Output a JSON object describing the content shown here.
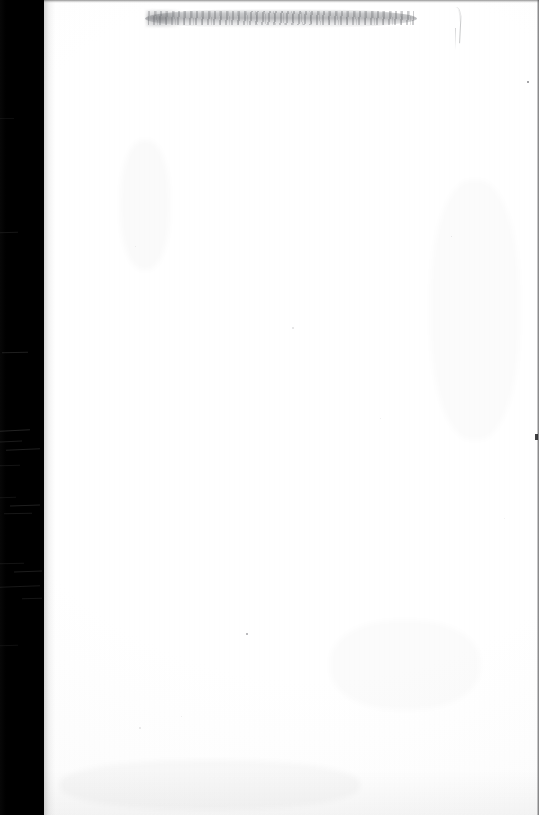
{
  "document": {
    "kind": "scanned-page",
    "title": "Scanned blank page",
    "page_state": "blank",
    "visible_text": "",
    "width_px": 539,
    "height_px": 815,
    "orientation": "portrait"
  },
  "colors": {
    "paper": "#ffffff",
    "paper_shade": "#fbfbfb",
    "gutter": "#000000",
    "smudge": "#808286",
    "edge_line": "#46464a",
    "speck": "#5a5a5e"
  },
  "regions": {
    "spine_gutter": {
      "name": "spine-gutter",
      "description": "black scanner void along the left binding edge",
      "x": 0,
      "y": 0,
      "width": 44,
      "height": 815
    },
    "paper": {
      "name": "paper-surface",
      "description": "blank white page surface",
      "x": 44,
      "y": 0,
      "width": 495,
      "height": 815
    },
    "top_smudge": {
      "name": "top-smudge-band",
      "description": "horizontal grey shadow smudge near the top edge of the sheet",
      "x": 145,
      "y": 9,
      "width": 272,
      "height": 19
    },
    "crease_stroke": {
      "name": "crease-stroke",
      "description": "faint curved pen or crease mark in the upper right",
      "x": 451,
      "y": 7,
      "width": 9,
      "height": 50
    },
    "right_edge": {
      "name": "right-edge-line",
      "description": "thin dark scan boundary along the right edge",
      "x": 537,
      "y": 0,
      "width": 2,
      "height": 815
    }
  },
  "gutter_scratches": [
    {
      "x": 0,
      "y": 232,
      "width": 18,
      "height": 1,
      "angle": -2,
      "opacity": 0.22
    },
    {
      "x": 2,
      "y": 352,
      "width": 26,
      "height": 1,
      "angle": -1.5,
      "opacity": 0.3
    },
    {
      "x": 0,
      "y": 430,
      "width": 30,
      "height": 1,
      "angle": -3,
      "opacity": 0.34
    },
    {
      "x": 0,
      "y": 441,
      "width": 22,
      "height": 1,
      "angle": -2,
      "opacity": 0.26
    },
    {
      "x": 6,
      "y": 449,
      "width": 34,
      "height": 1,
      "angle": -2.5,
      "opacity": 0.3
    },
    {
      "x": 0,
      "y": 465,
      "width": 20,
      "height": 1,
      "angle": -1,
      "opacity": 0.2
    },
    {
      "x": 0,
      "y": 497,
      "width": 16,
      "height": 1,
      "angle": -1,
      "opacity": 0.18
    },
    {
      "x": 10,
      "y": 505,
      "width": 30,
      "height": 1,
      "angle": -2,
      "opacity": 0.3
    },
    {
      "x": 4,
      "y": 513,
      "width": 28,
      "height": 1,
      "angle": -1.5,
      "opacity": 0.24
    },
    {
      "x": 0,
      "y": 563,
      "width": 24,
      "height": 1,
      "angle": -1,
      "opacity": 0.2
    },
    {
      "x": 14,
      "y": 571,
      "width": 28,
      "height": 1,
      "angle": -2,
      "opacity": 0.28
    },
    {
      "x": 0,
      "y": 586,
      "width": 40,
      "height": 1,
      "angle": -2.5,
      "opacity": 0.24
    },
    {
      "x": 22,
      "y": 598,
      "width": 20,
      "height": 1,
      "angle": -1,
      "opacity": 0.22
    },
    {
      "x": 0,
      "y": 645,
      "width": 18,
      "height": 1,
      "angle": -1,
      "opacity": 0.16
    },
    {
      "x": 0,
      "y": 118,
      "width": 14,
      "height": 1,
      "angle": -1,
      "opacity": 0.14
    }
  ],
  "specks": [
    {
      "x": 527,
      "y": 81,
      "size": 2,
      "opacity": 0.72
    },
    {
      "x": 246,
      "y": 633,
      "size": 2,
      "opacity": 0.55
    },
    {
      "x": 292,
      "y": 327,
      "size": 1.5,
      "opacity": 0.18
    },
    {
      "x": 139,
      "y": 727,
      "size": 1.5,
      "opacity": 0.14
    },
    {
      "x": 380,
      "y": 418,
      "size": 1,
      "opacity": 0.12
    },
    {
      "x": 451,
      "y": 236,
      "size": 1,
      "opacity": 0.16
    },
    {
      "x": 135,
      "y": 246,
      "size": 1,
      "opacity": 0.12
    },
    {
      "x": 181,
      "y": 716,
      "size": 1,
      "opacity": 0.12
    },
    {
      "x": 504,
      "y": 518,
      "size": 1,
      "opacity": 0.1
    }
  ],
  "blotches": [
    {
      "x": 120,
      "y": 140,
      "width": 50,
      "height": 130,
      "opacity": 0.02
    },
    {
      "x": 330,
      "y": 620,
      "width": 150,
      "height": 90,
      "opacity": 0.016
    },
    {
      "x": 60,
      "y": 760,
      "width": 300,
      "height": 50,
      "opacity": 0.022
    },
    {
      "x": 430,
      "y": 180,
      "width": 90,
      "height": 260,
      "opacity": 0.014
    }
  ]
}
